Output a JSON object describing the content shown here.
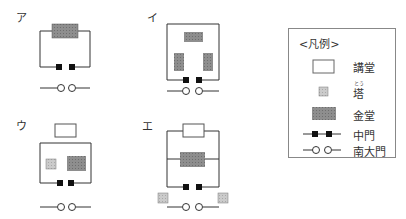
{
  "diagrams": [
    {
      "label": "ア"
    },
    {
      "label": "イ"
    },
    {
      "label": "ウ"
    },
    {
      "label": "エ"
    }
  ],
  "legend": {
    "title": "<凡例>",
    "items": [
      {
        "symbol": "white-rect",
        "label": "講堂"
      },
      {
        "symbol": "light-square",
        "label": "塔",
        "ruby": "とう"
      },
      {
        "symbol": "dark-rect",
        "label": "金堂"
      },
      {
        "symbol": "filled-squares-line",
        "label": "中門"
      },
      {
        "symbol": "open-circles-line",
        "label": "南大門"
      }
    ]
  },
  "colors": {
    "line": "#333333",
    "kondo_fill": "#8c8c8c",
    "tower_fill": "#c8c8c8",
    "lecture_fill": "#ffffff",
    "gate_fill": "#111111"
  }
}
